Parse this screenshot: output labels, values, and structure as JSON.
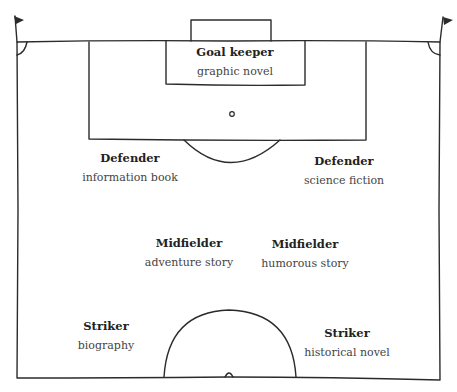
{
  "diagram": {
    "type": "football-pitch-lineup",
    "line_color": "#2b2b2b",
    "background": "#ffffff"
  },
  "players": [
    {
      "position": "goalkeeper",
      "role": "Goal keeper",
      "genre": "graphic novel"
    },
    {
      "position": "defender-left",
      "role": "Defender",
      "genre": "information book"
    },
    {
      "position": "defender-right",
      "role": "Defender",
      "genre": "science fiction"
    },
    {
      "position": "midfielder-left",
      "role": "Midfielder",
      "genre": "adventure story"
    },
    {
      "position": "midfielder-right",
      "role": "Midfielder",
      "genre": "humorous story"
    },
    {
      "position": "striker-left",
      "role": "Striker",
      "genre": "biography"
    },
    {
      "position": "striker-right",
      "role": "Striker",
      "genre": "historical novel"
    }
  ]
}
